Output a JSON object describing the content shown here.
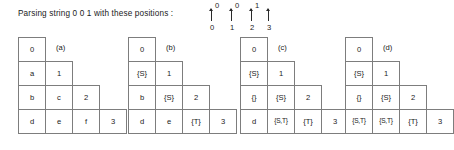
{
  "header": {
    "caption": "Parsing string 0 0 1  with  these  positions  :",
    "ruler": {
      "symbols": [
        "0",
        "0",
        "1",
        ""
      ],
      "indices": [
        "0",
        "1",
        "2",
        "3"
      ]
    }
  },
  "tables": [
    {
      "label": "(a)",
      "rows": [
        [
          "0"
        ],
        [
          "a",
          "1"
        ],
        [
          "b",
          "c",
          "2"
        ],
        [
          "d",
          "e",
          "f",
          "3"
        ]
      ]
    },
    {
      "label": "(b)",
      "rows": [
        [
          "0"
        ],
        [
          "{S}",
          "1"
        ],
        [
          "b",
          "{S}",
          "2"
        ],
        [
          "d",
          "e",
          "{T}",
          "3"
        ]
      ]
    },
    {
      "label": "(c)",
      "rows": [
        [
          "0"
        ],
        [
          "{S}",
          "1"
        ],
        [
          "{}",
          "{S}",
          "2"
        ],
        [
          "d",
          "{S,T}",
          "{T}",
          "3"
        ]
      ]
    },
    {
      "label": "(d)",
      "rows": [
        [
          "0"
        ],
        [
          "{S}",
          "1"
        ],
        [
          "{}",
          "{S}",
          "2"
        ],
        [
          "{S,T}",
          "{S,T}",
          "{T}",
          "3"
        ]
      ]
    }
  ],
  "colors": {
    "background": "#ffffff",
    "border": "#7d7d7d",
    "text": "#1a1a1a"
  }
}
